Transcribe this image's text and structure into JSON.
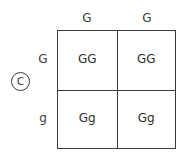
{
  "diagram": {
    "type": "punnett-square",
    "marker": {
      "label": "C",
      "shape": "circle"
    },
    "column_headers": [
      "G",
      "G"
    ],
    "row_headers": [
      "G",
      "g"
    ],
    "cells": [
      [
        "GG",
        "GG"
      ],
      [
        "Gg",
        "Gg"
      ]
    ],
    "colors": {
      "background": "#ffffff",
      "line": "#3a3a3a",
      "text": "#2e2e2e",
      "header_text": "#3c3c3c"
    }
  }
}
